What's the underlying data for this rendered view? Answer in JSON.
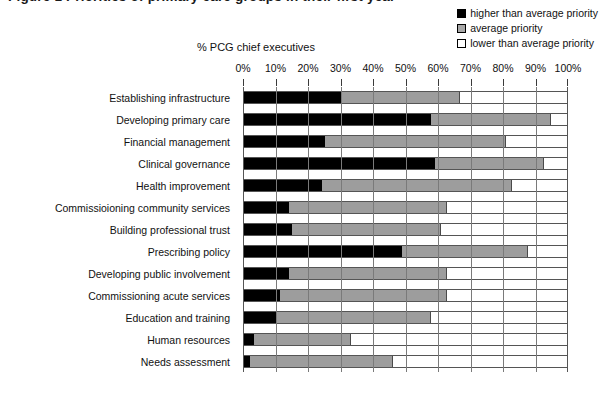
{
  "caption": "Figure 1  Priorities of primary care groups in their first year",
  "axis_title": "% PCG chief executives",
  "legend": [
    {
      "key": "higher",
      "label": "higher than average priority",
      "color": "#000000"
    },
    {
      "key": "average",
      "label": "average priority",
      "color": "#a8a8a8"
    },
    {
      "key": "lower",
      "label": "lower than average priority",
      "color": "#ffffff"
    }
  ],
  "chart_data": {
    "type": "bar",
    "orientation": "horizontal",
    "stacked": true,
    "stacked_normalized": true,
    "title": "Figure 1  Priorities of primary care groups in their first year",
    "xlabel": "% PCG chief executives",
    "ylabel": "",
    "xlim": [
      0,
      100
    ],
    "grid": true,
    "legend_position": "top-right",
    "tick_labels": [
      "0%",
      "10%",
      "20%",
      "30%",
      "40%",
      "50%",
      "60%",
      "70%",
      "80%",
      "90%",
      "100%"
    ],
    "ticks": [
      0,
      10,
      20,
      30,
      40,
      50,
      60,
      70,
      80,
      90,
      100
    ],
    "categories": [
      "Establishing infrastructure",
      "Developing primary care",
      "Financial management",
      "Clinical governance",
      "Health improvement",
      "Commissioioning community services",
      "Building professional trust",
      "Prescribing policy",
      "Developing public involvement",
      "Commissioning acute services",
      "Education and training",
      "Human resources",
      "Needs assessment"
    ],
    "series": [
      {
        "name": "higher than average priority",
        "color": "#000000",
        "values": [
          30,
          58,
          25,
          59,
          24,
          14,
          15,
          49,
          14,
          11,
          10,
          3,
          2
        ]
      },
      {
        "name": "average priority",
        "color": "#9d9d9d",
        "values": [
          37,
          37,
          56,
          34,
          59,
          49,
          46,
          39,
          49,
          52,
          48,
          30,
          44
        ]
      },
      {
        "name": "lower than average priority",
        "color": "#ffffff",
        "values": [
          33,
          5,
          19,
          7,
          17,
          37,
          39,
          12,
          37,
          37,
          42,
          67,
          54
        ]
      }
    ],
    "cumulative": [
      {
        "category": "Establishing infrastructure",
        "higher_end": 30,
        "average_end": 67
      },
      {
        "category": "Developing primary care",
        "higher_end": 58,
        "average_end": 95
      },
      {
        "category": "Financial management",
        "higher_end": 25,
        "average_end": 81
      },
      {
        "category": "Clinical governance",
        "higher_end": 59,
        "average_end": 93
      },
      {
        "category": "Health improvement",
        "higher_end": 24,
        "average_end": 83
      },
      {
        "category": "Commissioioning community services",
        "higher_end": 14,
        "average_end": 63
      },
      {
        "category": "Building professional trust",
        "higher_end": 15,
        "average_end": 61
      },
      {
        "category": "Prescribing policy",
        "higher_end": 49,
        "average_end": 88
      },
      {
        "category": "Developing public involvement",
        "higher_end": 14,
        "average_end": 63
      },
      {
        "category": "Commissioning acute services",
        "higher_end": 11,
        "average_end": 63
      },
      {
        "category": "Education and training",
        "higher_end": 10,
        "average_end": 58
      },
      {
        "category": "Human resources",
        "higher_end": 3,
        "average_end": 33
      },
      {
        "category": "Needs assessment",
        "higher_end": 2,
        "average_end": 46
      }
    ]
  }
}
